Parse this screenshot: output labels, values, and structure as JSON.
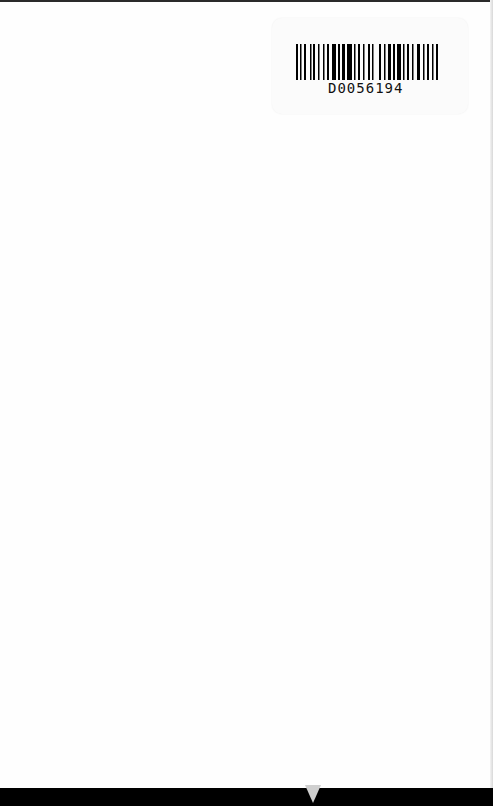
{
  "document": {
    "type": "scanned book page",
    "barcode": {
      "label": "D0056194",
      "icon": "barcode-icon"
    }
  }
}
